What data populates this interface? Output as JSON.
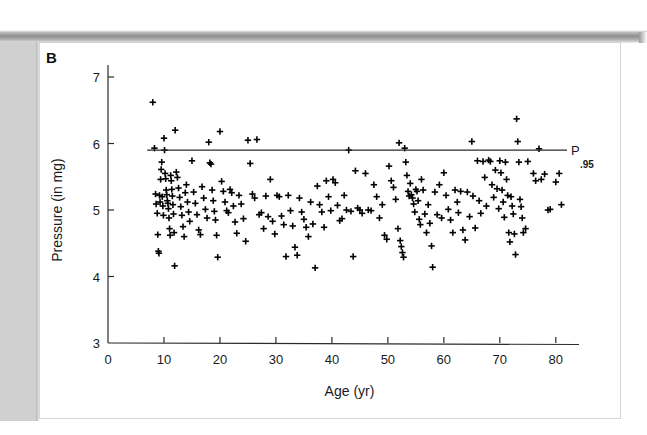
{
  "figure": {
    "panel_label": "B",
    "background_color": "#ffffff",
    "frame_color": "#d5d5d5",
    "scan_strip_color": "#d0d0d0"
  },
  "chart_data": {
    "type": "scatter",
    "title": "",
    "xlabel": "Age  (yr)",
    "ylabel": "Pressure  (in mg)",
    "xlim": [
      0,
      82
    ],
    "ylim": [
      3,
      7
    ],
    "xticks": [
      0,
      10,
      20,
      30,
      40,
      50,
      60,
      70,
      80
    ],
    "xticklabels": [
      "0",
      "10",
      "20",
      "30",
      "40",
      "50",
      "60",
      "70",
      "80"
    ],
    "yticks": [
      3,
      4,
      5,
      6,
      7
    ],
    "yticklabels": [
      "3",
      "4",
      "5",
      "6",
      "7"
    ],
    "grid": false,
    "legend": null,
    "marker": "+",
    "marker_color": "#000000",
    "annotations": [
      {
        "name": "percentile-line",
        "type": "hline",
        "y": 5.9,
        "x_start": 7.0,
        "x_end": 82.0,
        "label": "P",
        "sublabel": ".95",
        "color": "#2b2b2b"
      }
    ],
    "series": [
      {
        "name": "subjects",
        "marker": "+",
        "points": [
          [
            8.0,
            6.62
          ],
          [
            8.3,
            5.93
          ],
          [
            8.5,
            5.24
          ],
          [
            8.6,
            5.09
          ],
          [
            8.8,
            4.95
          ],
          [
            8.9,
            4.63
          ],
          [
            9.0,
            4.38
          ],
          [
            9.1,
            4.35
          ],
          [
            9.2,
            5.22
          ],
          [
            9.3,
            5.12
          ],
          [
            9.4,
            5.46
          ],
          [
            9.5,
            5.61
          ],
          [
            9.6,
            5.72
          ],
          [
            9.7,
            5.2
          ],
          [
            9.8,
            5.06
          ],
          [
            9.9,
            4.92
          ],
          [
            10.0,
            6.08
          ],
          [
            10.1,
            5.9
          ],
          [
            10.2,
            5.55
          ],
          [
            10.3,
            5.47
          ],
          [
            10.4,
            5.3
          ],
          [
            10.5,
            5.23
          ],
          [
            10.6,
            5.14
          ],
          [
            10.7,
            5.1
          ],
          [
            10.8,
            5.02
          ],
          [
            10.9,
            4.88
          ],
          [
            11.0,
            4.72
          ],
          [
            11.1,
            4.62
          ],
          [
            11.2,
            5.52
          ],
          [
            11.3,
            5.44
          ],
          [
            11.4,
            5.31
          ],
          [
            11.5,
            5.21
          ],
          [
            11.6,
            5.08
          ],
          [
            11.7,
            4.94
          ],
          [
            11.8,
            4.66
          ],
          [
            11.9,
            4.16
          ],
          [
            12.0,
            6.2
          ],
          [
            12.2,
            5.57
          ],
          [
            12.4,
            5.49
          ],
          [
            12.6,
            5.33
          ],
          [
            12.8,
            5.19
          ],
          [
            13.0,
            5.05
          ],
          [
            13.2,
            4.92
          ],
          [
            13.4,
            4.75
          ],
          [
            13.6,
            4.6
          ],
          [
            13.8,
            5.26
          ],
          [
            14.0,
            5.38
          ],
          [
            14.2,
            5.12
          ],
          [
            14.4,
            4.97
          ],
          [
            14.6,
            4.83
          ],
          [
            15.0,
            5.74
          ],
          [
            15.3,
            5.27
          ],
          [
            15.6,
            5.1
          ],
          [
            15.9,
            4.93
          ],
          [
            16.2,
            4.7
          ],
          [
            16.5,
            4.63
          ],
          [
            16.8,
            5.35
          ],
          [
            17.1,
            5.18
          ],
          [
            17.4,
            5.01
          ],
          [
            17.7,
            4.88
          ],
          [
            18.0,
            6.02
          ],
          [
            18.2,
            5.71
          ],
          [
            18.4,
            5.69
          ],
          [
            18.6,
            5.3
          ],
          [
            18.8,
            5.14
          ],
          [
            19.0,
            4.98
          ],
          [
            19.2,
            4.85
          ],
          [
            19.4,
            4.62
          ],
          [
            19.6,
            4.29
          ],
          [
            20.0,
            6.18
          ],
          [
            20.3,
            5.43
          ],
          [
            20.6,
            5.28
          ],
          [
            20.9,
            5.12
          ],
          [
            21.2,
            4.99
          ],
          [
            21.5,
            4.96
          ],
          [
            21.8,
            5.31
          ],
          [
            22.1,
            5.26
          ],
          [
            22.4,
            5.06
          ],
          [
            22.7,
            4.82
          ],
          [
            23.0,
            4.65
          ],
          [
            23.4,
            5.22
          ],
          [
            23.8,
            5.09
          ],
          [
            24.2,
            4.87
          ],
          [
            24.6,
            4.53
          ],
          [
            25.0,
            6.05
          ],
          [
            25.4,
            5.7
          ],
          [
            25.8,
            5.24
          ],
          [
            26.2,
            5.18
          ],
          [
            26.6,
            6.06
          ],
          [
            27.0,
            4.93
          ],
          [
            27.4,
            4.96
          ],
          [
            27.8,
            4.72
          ],
          [
            28.2,
            5.21
          ],
          [
            28.6,
            4.9
          ],
          [
            29.0,
            5.46
          ],
          [
            29.4,
            4.83
          ],
          [
            29.8,
            4.64
          ],
          [
            30.2,
            5.22
          ],
          [
            30.6,
            5.2
          ],
          [
            31.0,
            4.91
          ],
          [
            31.4,
            4.78
          ],
          [
            31.8,
            4.3
          ],
          [
            32.2,
            5.22
          ],
          [
            32.6,
            4.99
          ],
          [
            33.0,
            4.76
          ],
          [
            33.4,
            4.44
          ],
          [
            33.8,
            4.32
          ],
          [
            34.2,
            5.18
          ],
          [
            34.6,
            4.97
          ],
          [
            35.0,
            4.86
          ],
          [
            35.4,
            4.74
          ],
          [
            35.8,
            4.6
          ],
          [
            36.2,
            5.12
          ],
          [
            36.6,
            4.79
          ],
          [
            37.0,
            4.13
          ],
          [
            37.4,
            5.36
          ],
          [
            37.8,
            5.08
          ],
          [
            38.2,
            4.97
          ],
          [
            38.6,
            4.74
          ],
          [
            39.0,
            5.44
          ],
          [
            39.4,
            5.2
          ],
          [
            39.8,
            4.99
          ],
          [
            40.2,
            5.46
          ],
          [
            40.6,
            5.41
          ],
          [
            41.0,
            5.07
          ],
          [
            41.4,
            4.84
          ],
          [
            41.8,
            4.87
          ],
          [
            42.2,
            5.22
          ],
          [
            42.6,
            5.0
          ],
          [
            43.0,
            5.9
          ],
          [
            43.4,
            4.98
          ],
          [
            43.8,
            4.3
          ],
          [
            44.2,
            5.59
          ],
          [
            44.6,
            5.03
          ],
          [
            45.0,
            5.0
          ],
          [
            45.4,
            4.95
          ],
          [
            46.0,
            5.55
          ],
          [
            46.5,
            5.0
          ],
          [
            47.0,
            4.99
          ],
          [
            47.5,
            5.38
          ],
          [
            48.0,
            5.2
          ],
          [
            48.5,
            4.88
          ],
          [
            49.0,
            5.08
          ],
          [
            49.4,
            4.62
          ],
          [
            49.8,
            4.56
          ],
          [
            50.2,
            5.66
          ],
          [
            50.6,
            5.44
          ],
          [
            51.0,
            5.34
          ],
          [
            51.4,
            5.16
          ],
          [
            51.8,
            4.72
          ],
          [
            52.0,
            6.01
          ],
          [
            52.2,
            4.54
          ],
          [
            52.4,
            4.45
          ],
          [
            52.6,
            4.36
          ],
          [
            52.8,
            4.29
          ],
          [
            53.0,
            5.93
          ],
          [
            53.2,
            5.72
          ],
          [
            53.4,
            5.52
          ],
          [
            53.6,
            5.28
          ],
          [
            53.8,
            5.21
          ],
          [
            54.0,
            5.4
          ],
          [
            54.2,
            5.23
          ],
          [
            54.4,
            5.18
          ],
          [
            54.6,
            5.09
          ],
          [
            54.8,
            4.97
          ],
          [
            55.0,
            5.31
          ],
          [
            55.2,
            5.28
          ],
          [
            55.4,
            5.14
          ],
          [
            55.6,
            4.86
          ],
          [
            55.8,
            4.78
          ],
          [
            56.0,
            5.46
          ],
          [
            56.3,
            5.3
          ],
          [
            56.6,
            4.94
          ],
          [
            56.9,
            4.66
          ],
          [
            57.2,
            5.08
          ],
          [
            57.5,
            4.8
          ],
          [
            57.8,
            4.46
          ],
          [
            58.0,
            4.14
          ],
          [
            58.4,
            5.27
          ],
          [
            58.8,
            4.93
          ],
          [
            59.2,
            5.38
          ],
          [
            59.6,
            4.88
          ],
          [
            60.0,
            5.56
          ],
          [
            60.4,
            5.22
          ],
          [
            60.8,
            5.01
          ],
          [
            61.2,
            4.85
          ],
          [
            61.6,
            4.66
          ],
          [
            62.0,
            5.3
          ],
          [
            62.4,
            5.12
          ],
          [
            62.6,
            4.96
          ],
          [
            63.0,
            5.28
          ],
          [
            63.4,
            4.7
          ],
          [
            63.8,
            4.55
          ],
          [
            64.2,
            5.27
          ],
          [
            64.6,
            4.9
          ],
          [
            65.0,
            6.03
          ],
          [
            65.2,
            5.21
          ],
          [
            65.6,
            4.73
          ],
          [
            66.0,
            5.74
          ],
          [
            66.3,
            5.14
          ],
          [
            66.6,
            4.95
          ],
          [
            67.0,
            5.73
          ],
          [
            67.3,
            5.49
          ],
          [
            67.6,
            5.06
          ],
          [
            68.0,
            5.75
          ],
          [
            68.3,
            5.73
          ],
          [
            68.6,
            5.38
          ],
          [
            68.9,
            5.19
          ],
          [
            69.2,
            5.6
          ],
          [
            69.5,
            5.32
          ],
          [
            69.8,
            5.02
          ],
          [
            70.0,
            5.74
          ],
          [
            70.2,
            5.56
          ],
          [
            70.4,
            5.3
          ],
          [
            70.6,
            5.12
          ],
          [
            70.8,
            4.89
          ],
          [
            71.0,
            5.72
          ],
          [
            71.2,
            5.46
          ],
          [
            71.4,
            5.22
          ],
          [
            71.6,
            4.66
          ],
          [
            71.8,
            4.52
          ],
          [
            72.0,
            5.2
          ],
          [
            72.2,
            5.06
          ],
          [
            72.4,
            4.94
          ],
          [
            72.6,
            4.64
          ],
          [
            72.8,
            4.33
          ],
          [
            73.0,
            6.37
          ],
          [
            73.2,
            6.03
          ],
          [
            73.4,
            5.72
          ],
          [
            73.6,
            5.16
          ],
          [
            73.8,
            5.05
          ],
          [
            74.0,
            4.88
          ],
          [
            74.2,
            4.66
          ],
          [
            74.6,
            4.72
          ],
          [
            75.0,
            5.73
          ],
          [
            76.0,
            5.55
          ],
          [
            76.4,
            5.44
          ],
          [
            77.0,
            5.92
          ],
          [
            77.4,
            5.46
          ],
          [
            78.0,
            5.54
          ],
          [
            78.6,
            5.0
          ],
          [
            79.0,
            5.01
          ],
          [
            80.0,
            5.42
          ],
          [
            80.6,
            5.55
          ],
          [
            81.0,
            5.08
          ]
        ]
      }
    ]
  }
}
